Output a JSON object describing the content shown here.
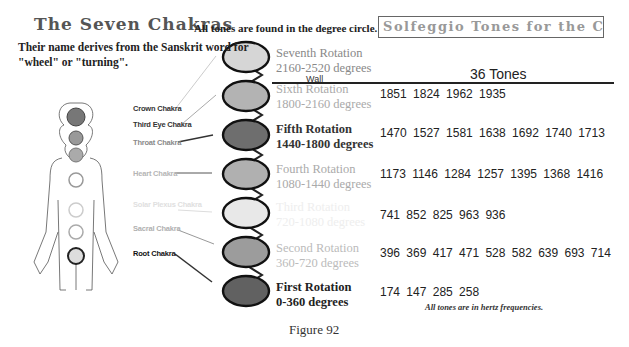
{
  "header": {
    "title": "The Seven Chakras",
    "subtitle": "Their name derives from the Sanskrit word for \"wheel\" or \"turning\".",
    "degree_note": "All tones are found in the degree circle.",
    "box_title": "Solfeggio Tones for the Chakras"
  },
  "table": {
    "column_header": "36 Tones",
    "wall_label": "Wall"
  },
  "chakras": [
    {
      "label": "Crown Chakra",
      "color": "#333333"
    },
    {
      "label": "Third Eye Chakra",
      "color": "#333333"
    },
    {
      "label": "Throat Chakra",
      "color": "#8a8a8a"
    },
    {
      "label": "Heart Chakra",
      "color": "#b5b5b5"
    },
    {
      "label": "Solar Plexus Chakra",
      "color": "#e0e0e0"
    },
    {
      "label": "Sacral Chakra",
      "color": "#b0b0b0"
    },
    {
      "label": "Root Chakra",
      "color": "#111111"
    }
  ],
  "rotations": [
    {
      "name": "Seventh Rotation",
      "range": "2160-2520 degrees",
      "tones": "",
      "fill": "#d6d6d6",
      "text_color": "#888888"
    },
    {
      "name": "Sixth Rotation",
      "range": "1800-2160 degrees",
      "tones": "1851 1824 1962 1935",
      "fill": "#b3b3b3",
      "text_color": "#aaaaaa"
    },
    {
      "name": "Fifth Rotation",
      "range": "1440-1800 degrees",
      "tones": "1470 1527 1581 1638 1692 1740 1713",
      "fill": "#6e6e6e",
      "text_color": "#333333"
    },
    {
      "name": "Fourth Rotation",
      "range": "1080-1440 degrees",
      "tones": "1173 1146 1284 1257 1395 1368 1416",
      "fill": "#b0b0b0",
      "text_color": "#aaaaaa"
    },
    {
      "name": "Third Rotation",
      "range": "720-1080 degrees",
      "tones": "741 852 825 963 936",
      "fill": "#e8e8e8",
      "text_color": "#eeeeee"
    },
    {
      "name": "Second Rotation",
      "range": "360-720 degrees",
      "tones": "396 369 417 471 528 582 639 693 714",
      "fill": "#9c9c9c",
      "text_color": "#bbbbbb"
    },
    {
      "name": "First Rotation",
      "range": "0-360 degrees",
      "tones": "174 147 285 258",
      "fill": "#616161",
      "text_color": "#222222"
    }
  ],
  "footer": {
    "note": "All tones are in hertz frequencies.",
    "figure_label": "Figure 92"
  }
}
